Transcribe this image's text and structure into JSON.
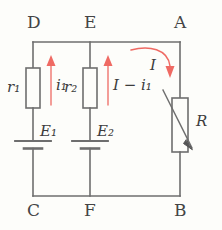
{
  "figure": {
    "type": "circuit-diagram",
    "wire_color": "#6e6e6e",
    "label_color": "#3c3c3c",
    "current_color": "#ef6a63",
    "background": "#fdfdfa"
  },
  "nodes": {
    "top_left": "D",
    "top_mid": "E",
    "top_right": "A",
    "bottom_left": "C",
    "bottom_mid": "F",
    "bottom_right": "B"
  },
  "components": {
    "resistor_1": {
      "name": "r",
      "subscript": "1",
      "label": "r₁"
    },
    "resistor_2": {
      "name": "r",
      "subscript": "2",
      "label": "r₂"
    },
    "battery_1": {
      "name": "E",
      "subscript": "1",
      "label": "E₁"
    },
    "battery_2": {
      "name": "E",
      "subscript": "2",
      "label": "E₂"
    },
    "rheostat": {
      "name": "R",
      "label": "R",
      "variable": true
    }
  },
  "currents": {
    "branch_left": {
      "symbol": "i",
      "subscript": "1",
      "label": "i₁",
      "direction": "up"
    },
    "branch_mid": {
      "symbol": "I − i",
      "subscript": "1",
      "label": "I − i₁",
      "direction": "up"
    },
    "branch_right": {
      "symbol": "I",
      "label": "I",
      "direction": "down"
    }
  }
}
